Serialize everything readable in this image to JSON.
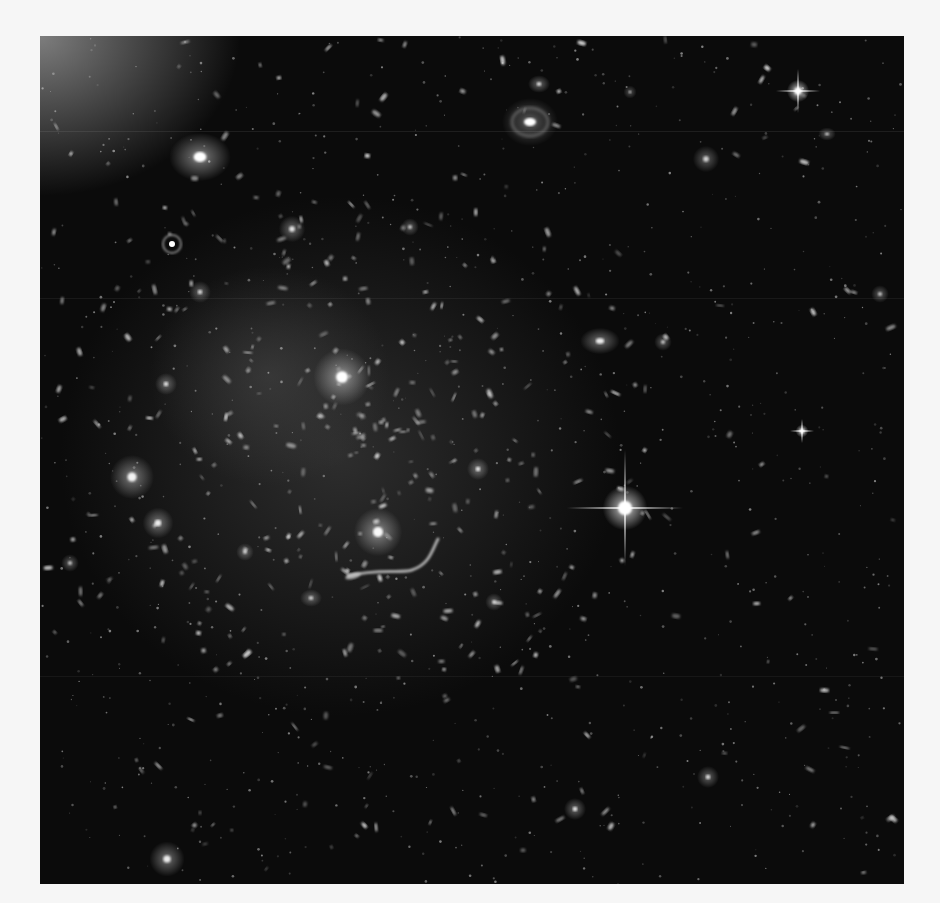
{
  "image": {
    "subject": "Galaxy cluster deep-field photograph",
    "description": "Grayscale space telescope image of a galaxy cluster with many elliptical and spiral galaxies, a bright foreground star with diffraction spikes, and a gravitationally lensed arc near the center",
    "colors": {
      "page_background": "#f6f6f6",
      "sky_background": "#0b0b0b",
      "galaxy_light": "#e8e8e8",
      "intracluster_glow": "#3a3a3a"
    },
    "features": [
      {
        "name": "bright-foreground-star",
        "kind": "star with diffraction spikes"
      },
      {
        "name": "secondary-star",
        "kind": "star with diffraction spikes"
      },
      {
        "name": "spiral-galaxy",
        "kind": "face-on spiral galaxy"
      },
      {
        "name": "bright-elliptical-galaxy",
        "kind": "elliptical galaxy"
      },
      {
        "name": "central-cluster-galaxy",
        "kind": "brightest cluster galaxy"
      },
      {
        "name": "lensed-arc",
        "kind": "gravitationally lensed arc"
      },
      {
        "name": "galaxy-group-left",
        "kind": "galaxy group"
      }
    ]
  }
}
